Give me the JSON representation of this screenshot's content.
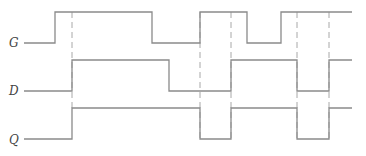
{
  "signals": [
    {
      "name": "G",
      "high_y": 12,
      "low_y": 43,
      "transitions": [
        [
          24,
          0
        ],
        [
          55,
          1
        ],
        [
          152,
          0
        ],
        [
          200,
          1
        ],
        [
          247,
          0
        ],
        [
          281,
          1
        ],
        [
          352,
          1
        ]
      ]
    },
    {
      "name": "D",
      "high_y": 60,
      "low_y": 91,
      "transitions": [
        [
          24,
          0
        ],
        [
          72,
          1
        ],
        [
          169,
          0
        ],
        [
          231,
          1
        ],
        [
          297,
          0
        ],
        [
          329,
          1
        ],
        [
          352,
          1
        ]
      ]
    },
    {
      "name": "Q",
      "high_y": 108,
      "low_y": 139,
      "transitions": [
        [
          24,
          0
        ],
        [
          72,
          1
        ],
        [
          200,
          0
        ],
        [
          231,
          1
        ],
        [
          297,
          0
        ],
        [
          329,
          1
        ],
        [
          352,
          1
        ]
      ]
    }
  ],
  "dashed_lines": [
    {
      "x": 72,
      "y1": 12,
      "y2": 108
    },
    {
      "x": 200,
      "y1": 12,
      "y2": 139
    },
    {
      "x": 231,
      "y1": 12,
      "y2": 139
    },
    {
      "x": 297,
      "y1": 12,
      "y2": 139
    },
    {
      "x": 329,
      "y1": 12,
      "y2": 139
    }
  ],
  "colors": {
    "line": "#8a8a8a",
    "dashed": "#a8a8a8"
  }
}
